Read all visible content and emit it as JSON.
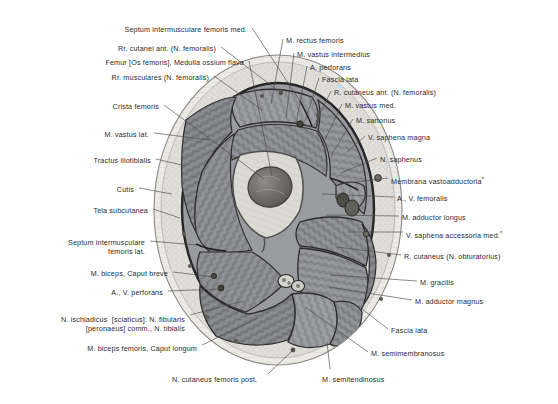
{
  "figure": {
    "view": "transverse section, right thigh, distal middle third",
    "palette": {
      "background": "#ffffff",
      "skin_cutis": "#e8e7e4",
      "subcutaneous": "#dedcd8",
      "fascia_lata": "#3a3a3a",
      "muscle_mid": "#8f9093",
      "muscle_dark": "#6f7073",
      "muscle_light": "#a8a9ac",
      "bone_cortical": "#d8d8d2",
      "bone_marrow": "#6a6a68",
      "vessel": "#4a4a4a",
      "outline": "#2b2b2b",
      "leader_line": "#4a4a4a",
      "text": "#2b2b2b"
    }
  },
  "labels_left": [
    {
      "id": "septum-intermusculare-femoris-med",
      "text": "Septum intermusculare femoris med.",
      "x": 247,
      "y": 25,
      "lx": 252,
      "ly": 28,
      "tx": 300,
      "ty": 101
    },
    {
      "id": "rr-cutanei-ant-n-femoralis",
      "text": "Rr. cutanei ant. (N. femoralis)",
      "x": 216,
      "y": 44,
      "lx": 221,
      "ly": 47,
      "tx": 281,
      "ty": 93
    },
    {
      "id": "femur-os-femoris-medulla-ossium-flava",
      "text": "Femur [Os femoris], Medulla ossium flava",
      "x": 244,
      "y": 58,
      "lx": 249,
      "ly": 61,
      "tx": 272,
      "ty": 176
    },
    {
      "id": "rr-musculares-n-femoralis",
      "text": "Rr. musculares (N. femoralis)",
      "x": 209,
      "y": 73,
      "lx": 214,
      "ly": 76,
      "tx": 262,
      "ty": 110
    },
    {
      "id": "crista-femoris",
      "text": "Crista femoris",
      "x": 159,
      "y": 102,
      "lx": 164,
      "ly": 105,
      "tx": 264,
      "ty": 179
    },
    {
      "id": "m-vastus-lat",
      "text": "M. vastus lat.",
      "x": 149,
      "y": 130,
      "lx": 154,
      "ly": 133,
      "tx": 210,
      "ty": 140
    },
    {
      "id": "tractus-iliotibialis",
      "text": "Tractus iliotibialis",
      "x": 151,
      "y": 156,
      "lx": 156,
      "ly": 159,
      "tx": 186,
      "ty": 166
    },
    {
      "id": "cutis",
      "text": "Cutis",
      "x": 134,
      "y": 185,
      "lx": 139,
      "ly": 188,
      "tx": 172,
      "ty": 194
    },
    {
      "id": "tela-subcutanea",
      "text": "Tela subcutanea",
      "x": 148,
      "y": 206,
      "lx": 153,
      "ly": 209,
      "tx": 180,
      "ty": 218
    },
    {
      "id": "septum-intermusculare-femoris-lat",
      "text": "Septum intermusculare\nfemoris lat.",
      "x": 145,
      "y": 238,
      "lx": 150,
      "ly": 241,
      "tx": 196,
      "ty": 245
    },
    {
      "id": "m-biceps-caput-breve",
      "text": "M. biceps, Caput breve",
      "x": 168,
      "y": 269,
      "lx": 173,
      "ly": 272,
      "tx": 214,
      "ty": 277
    },
    {
      "id": "a-v-perforans",
      "text": "A., V. perforans",
      "x": 163,
      "y": 288,
      "lx": 168,
      "ly": 291,
      "tx": 219,
      "ty": 289
    },
    {
      "id": "n-ischiadicus-sciaticus",
      "text": "N. ischiadicus  [sciaticus]: N. fibularis\n[peronaeus] comm., N. tibialis",
      "x": 185,
      "y": 315,
      "lx": 190,
      "ly": 315,
      "tx": 243,
      "ty": 301
    },
    {
      "id": "m-biceps-femoris-caput-longum",
      "text": "M. biceps femoris, Caput longum",
      "x": 197,
      "y": 344,
      "lx": 202,
      "ly": 345,
      "tx": 258,
      "ty": 318
    }
  ],
  "labels_right": [
    {
      "id": "m-rectus-femoris",
      "text": "M. rectus femoris",
      "x": 286,
      "y": 36,
      "lx": 283,
      "ly": 39,
      "tx": 271,
      "ty": 104
    },
    {
      "id": "m-vastus-intermedius",
      "text": "M. vastus intermedius",
      "x": 297,
      "y": 50,
      "lx": 294,
      "ly": 53,
      "tx": 286,
      "ty": 118
    },
    {
      "id": "a-perforans",
      "text": "A. perforans",
      "x": 310,
      "y": 63,
      "lx": 307,
      "ly": 66,
      "tx": 296,
      "ty": 124
    },
    {
      "id": "fascia-lata-top",
      "text": "Fascia lata",
      "x": 322,
      "y": 75,
      "lx": 319,
      "ly": 78,
      "tx": 305,
      "ty": 121
    },
    {
      "id": "r-cutaneus-ant-n-femoralis",
      "text": "R. cutaneus ant. (N. femoralis)",
      "x": 334,
      "y": 88,
      "lx": 331,
      "ly": 91,
      "tx": 313,
      "ty": 128
    },
    {
      "id": "m-vastus-med",
      "text": "M. vastus med.",
      "x": 345,
      "y": 101,
      "lx": 342,
      "ly": 104,
      "tx": 322,
      "ty": 146
    },
    {
      "id": "m-sartorius",
      "text": "M. sartorius",
      "x": 356,
      "y": 116,
      "lx": 353,
      "ly": 119,
      "tx": 331,
      "ty": 156
    },
    {
      "id": "v-saphena-magna",
      "text": "V. saphena magna",
      "x": 368,
      "y": 133,
      "lx": 365,
      "ly": 136,
      "tx": 347,
      "ty": 152
    },
    {
      "id": "n-saphenus",
      "text": "N. saphenus",
      "x": 380,
      "y": 155,
      "lx": 377,
      "ly": 158,
      "tx": 341,
      "ty": 173
    },
    {
      "id": "membrana-vastoadductoria",
      "text": "Membrana vastoadductoria",
      "sup": "*",
      "x": 391,
      "y": 175,
      "lx": 388,
      "ly": 178,
      "tx": 340,
      "ty": 184
    },
    {
      "id": "a-v-femoralis",
      "text": "A., V. femoralis",
      "x": 397,
      "y": 194,
      "lx": 394,
      "ly": 197,
      "tx": 322,
      "ty": 194
    },
    {
      "id": "m-adductor-longus",
      "text": "M. adductor longus",
      "x": 402,
      "y": 213,
      "lx": 399,
      "ly": 216,
      "tx": 326,
      "ty": 215
    },
    {
      "id": "v-saphena-accessoria-med",
      "text": "V. saphena accessoria med.",
      "sup": "*",
      "x": 406,
      "y": 229,
      "lx": 403,
      "ly": 232,
      "tx": 348,
      "ty": 232
    },
    {
      "id": "r-cutaneus-n-obturatorius",
      "text": "R. cutaneus (N. obturatorius)",
      "x": 404,
      "y": 252,
      "lx": 401,
      "ly": 255,
      "tx": 337,
      "ty": 247
    },
    {
      "id": "m-gracilis",
      "text": "M. gracilis",
      "x": 420,
      "y": 278,
      "lx": 417,
      "ly": 281,
      "tx": 330,
      "ty": 275
    },
    {
      "id": "m-adductor-magnus",
      "text": "M. adductor magnus",
      "x": 415,
      "y": 297,
      "lx": 412,
      "ly": 300,
      "tx": 329,
      "ty": 287
    },
    {
      "id": "fascia-lata-bottom",
      "text": "Fascia lata",
      "x": 391,
      "y": 326,
      "lx": 388,
      "ly": 329,
      "tx": 362,
      "ty": 309
    },
    {
      "id": "m-semimembranosus",
      "text": "M. semimembranosus",
      "x": 371,
      "y": 349,
      "lx": 368,
      "ly": 352,
      "tx": 305,
      "ty": 307
    }
  ],
  "labels_bottom": [
    {
      "id": "n-cutaneus-femoris-post",
      "text": "N. cutaneus femoris post.",
      "x": 172,
      "y": 375,
      "lx": 268,
      "ly": 374,
      "tx": 293,
      "ty": 350
    },
    {
      "id": "m-semitendinosus",
      "text": "M. semitendinosus",
      "x": 322,
      "y": 375,
      "lx": 330,
      "ly": 369,
      "tx": 327,
      "ty": 342
    }
  ],
  "footnote_marker": "*"
}
